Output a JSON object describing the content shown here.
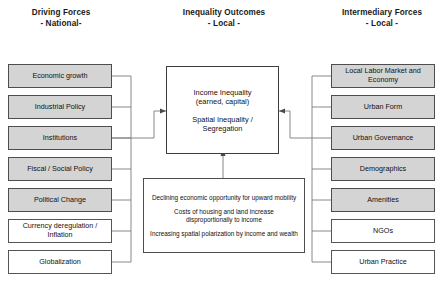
{
  "columns": {
    "left": {
      "title": "Driving Forces",
      "subtitle": "- National-",
      "items": [
        {
          "label": "Economic growth",
          "style": "gray"
        },
        {
          "label": "Industrial Policy",
          "style": "gray"
        },
        {
          "label": "Institutions",
          "style": "gray"
        },
        {
          "label": "Fiscal / Social Policy",
          "style": "gray"
        },
        {
          "label": "Political Change",
          "style": "gray"
        },
        {
          "label": "Currency deregulation / Inflation",
          "style": "white"
        },
        {
          "label": "Globalization",
          "style": "white"
        }
      ]
    },
    "center": {
      "title": "Inequality Outcomes",
      "subtitle": "- Local -",
      "outcome_line_1": "Income Inequality",
      "outcome_line_2": "(earned, capital)",
      "outcome_line_3": "Spatial Inequality /",
      "outcome_line_4": "Segregation",
      "notes": [
        "Declining economic opportunity for upward mobility",
        "Costs of housing and land increase disproportionally to income",
        "Increasing spatial polarization by income and wealth"
      ]
    },
    "right": {
      "title": "Intermediary Forces",
      "subtitle": "- Local -",
      "items": [
        {
          "label": "Local Labor Market and Economy",
          "style": "gray"
        },
        {
          "label": "Urban Form",
          "style": "gray"
        },
        {
          "label": "Urban Governance",
          "style": "gray"
        },
        {
          "label": "Demographics",
          "style": "gray"
        },
        {
          "label": "Amenities",
          "style": "gray"
        },
        {
          "label": "NGOs",
          "style": "white"
        },
        {
          "label": "Urban Practice",
          "style": "white"
        }
      ]
    }
  },
  "colors": {
    "node_fill_gray": "#d4d4d4",
    "node_fill_white": "#ffffff",
    "node_border": "#4d4d4d",
    "line": "#6e6e6e",
    "text": "#111111",
    "background": "#ffffff"
  }
}
